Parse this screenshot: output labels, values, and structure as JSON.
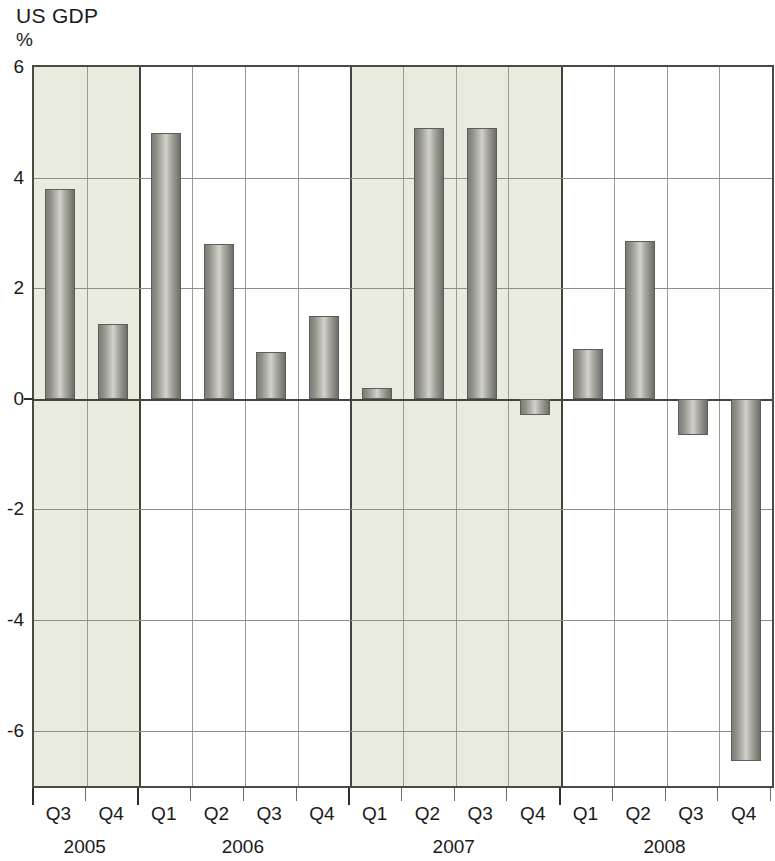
{
  "chart_data": {
    "type": "bar",
    "title": "US GDP",
    "subtitle": "",
    "xlabel": "",
    "ylabel": "%",
    "ylim": [
      -7.0,
      6.0
    ],
    "yticks": [
      6,
      4,
      2,
      0,
      -2,
      -4,
      -6
    ],
    "ytick_labels": [
      "6",
      "4",
      "2",
      "0",
      "-2",
      "-4",
      "-6"
    ],
    "grid": true,
    "legend": "none",
    "categories": [
      "Q3",
      "Q4",
      "Q1",
      "Q2",
      "Q3",
      "Q4",
      "Q1",
      "Q2",
      "Q3",
      "Q4",
      "Q1",
      "Q2",
      "Q3",
      "Q4"
    ],
    "values": [
      3.8,
      1.35,
      4.8,
      2.8,
      0.85,
      1.5,
      0.2,
      4.9,
      4.9,
      -0.3,
      0.9,
      2.85,
      -0.65,
      -6.55
    ],
    "groups": [
      {
        "year": "2005",
        "quarters": [
          "Q3",
          "Q4"
        ],
        "values": [
          3.8,
          1.35
        ],
        "shaded": true
      },
      {
        "year": "2006",
        "quarters": [
          "Q1",
          "Q2",
          "Q3",
          "Q4"
        ],
        "values": [
          4.8,
          2.8,
          0.85,
          1.5
        ],
        "shaded": false
      },
      {
        "year": "2007",
        "quarters": [
          "Q1",
          "Q2",
          "Q3",
          "Q4"
        ],
        "values": [
          0.2,
          4.9,
          4.9,
          -0.3
        ],
        "shaded": true
      },
      {
        "year": "2008",
        "quarters": [
          "Q1",
          "Q2",
          "Q3",
          "Q4"
        ],
        "values": [
          0.9,
          2.85,
          -0.65,
          -6.55
        ],
        "shaded": false
      }
    ],
    "colors": {
      "bar": "#9a9a93",
      "bar_edge": "#5e5e58",
      "band": "#e9ebdf",
      "grid": "#8e8e84",
      "axis": "#44443e",
      "background": "#ffffff"
    }
  }
}
